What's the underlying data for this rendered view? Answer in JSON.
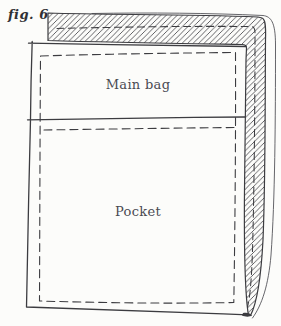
{
  "figure": {
    "label": "fig. 6",
    "regions": {
      "main_bag": {
        "label": "Main bag"
      },
      "pocket": {
        "label": "Pocket"
      }
    },
    "style": {
      "paper_color": "#fcfcfa",
      "ink_color": "#3c3c40",
      "text_color": "#4a4a52",
      "hatch": "diagonal-lines"
    }
  }
}
